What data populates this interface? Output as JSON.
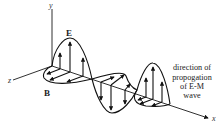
{
  "diagram": {
    "axes": {
      "y_label": "y",
      "z_label": "z",
      "x_label": "x"
    },
    "field_labels": {
      "electric": "E",
      "magnetic": "B"
    },
    "annotation": {
      "lines": [
        "direction of",
        "propogation",
        "of E-M",
        "wave"
      ]
    },
    "colors": {
      "ink": "#111111",
      "background": "#ffffff"
    }
  }
}
